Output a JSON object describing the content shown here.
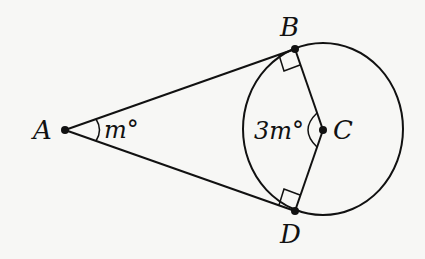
{
  "diagram": {
    "type": "geometry",
    "colors": {
      "stroke": "#111111",
      "background": "#f7f7f5"
    },
    "points": [
      {
        "id": "A",
        "label": "A",
        "x": 65,
        "y": 130
      },
      {
        "id": "B",
        "label": "B",
        "x": 295,
        "y": 49
      },
      {
        "id": "C",
        "label": "C",
        "x": 323,
        "y": 130
      },
      {
        "id": "D",
        "label": "D",
        "x": 295,
        "y": 211
      }
    ],
    "segments": [
      [
        "A",
        "B"
      ],
      [
        "A",
        "D"
      ],
      [
        "B",
        "C"
      ],
      [
        "C",
        "D"
      ]
    ],
    "circle": {
      "center": "C",
      "cx": 323,
      "cy": 129,
      "rx": 80,
      "ry": 86
    },
    "right_angles": [
      "B",
      "D"
    ],
    "angles": [
      {
        "vertex": "A",
        "label": "m°"
      },
      {
        "vertex": "C",
        "label": "3m°"
      }
    ]
  }
}
